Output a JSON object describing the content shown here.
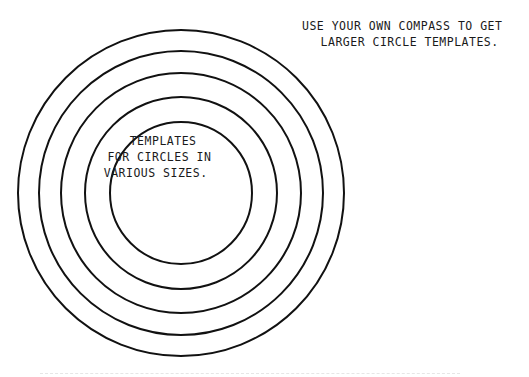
{
  "top_note": {
    "line1": "USE YOUR OWN COMPASS TO GET",
    "line2": "  LARGER CIRCLE TEMPLATES."
  },
  "center_note": {
    "line1": "  TEMPLATES",
    "line2": " FOR CIRCLES IN",
    "line3": "VARIOUS SIZES."
  },
  "circles": {
    "center": [
      181,
      193
    ],
    "radii": [
      163,
      142,
      120,
      96,
      71
    ],
    "stroke_color": "#111111"
  }
}
